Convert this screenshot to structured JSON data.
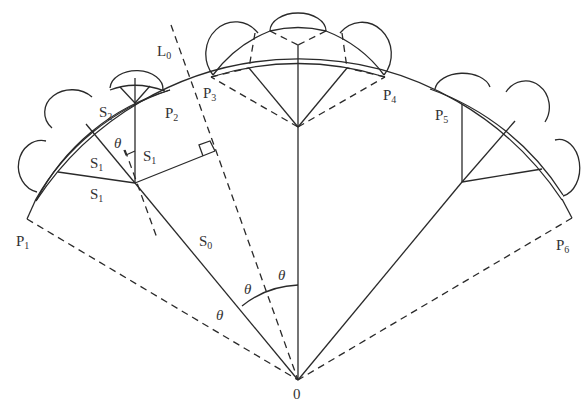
{
  "diagram": {
    "type": "geometric construction",
    "labels": {
      "origin": "0",
      "line_L0": {
        "main": "L",
        "sub": "0"
      },
      "P1": {
        "main": "P",
        "sub": "1"
      },
      "P2": {
        "main": "P",
        "sub": "2"
      },
      "P3": {
        "main": "P",
        "sub": "3"
      },
      "P4": {
        "main": "P",
        "sub": "4"
      },
      "P5": {
        "main": "P",
        "sub": "5"
      },
      "P6": {
        "main": "P",
        "sub": "6"
      },
      "S0": {
        "main": "S",
        "sub": "0"
      },
      "S1_a": {
        "main": "S",
        "sub": "1"
      },
      "S1_b": {
        "main": "S",
        "sub": "1"
      },
      "S1_c": {
        "main": "S",
        "sub": "1"
      },
      "S2": {
        "main": "S",
        "sub": "2"
      },
      "theta": "θ"
    },
    "angle_labels": [
      "θ",
      "θ",
      "θ",
      "θ"
    ],
    "colors": {
      "stroke": "#2a2a2a",
      "text": "#333333",
      "background": "#ffffff"
    }
  }
}
